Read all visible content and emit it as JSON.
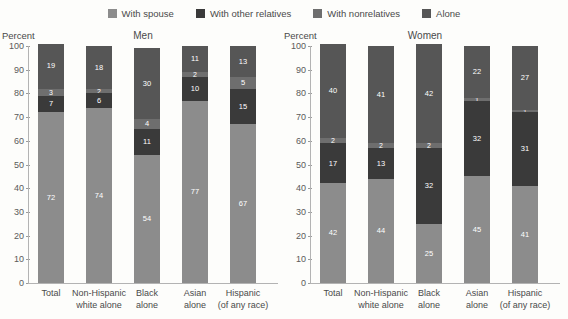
{
  "legend": {
    "items": [
      {
        "label": "With spouse",
        "color": "#8c8c8c",
        "icon": "square-swatch-icon"
      },
      {
        "label": "With other relatives",
        "color": "#3a3a3a",
        "icon": "square-swatch-icon"
      },
      {
        "label": "With nonrelatives",
        "color": "#6e6e6e",
        "icon": "square-swatch-icon"
      },
      {
        "label": "Alone",
        "color": "#565656",
        "icon": "square-swatch-icon"
      }
    ]
  },
  "chart_data": {
    "type": "bar",
    "subtype": "stacked-percent",
    "title": "",
    "panels": [
      {
        "title": "Men",
        "ylabel": "Percent",
        "xlabel": "",
        "ylim": [
          0,
          100
        ],
        "yticks": [
          0,
          10,
          20,
          30,
          40,
          50,
          60,
          70,
          80,
          90,
          100
        ],
        "grid": false,
        "categories": [
          "Total",
          "Non-Hispanic white alone",
          "Black alone",
          "Asian alone",
          "Hispanic (of any race)"
        ],
        "series": [
          {
            "name": "With spouse",
            "color": "#8c8c8c",
            "values": [
              72,
              74,
              54,
              77,
              67
            ]
          },
          {
            "name": "With other relatives",
            "color": "#3a3a3a",
            "values": [
              7,
              6,
              11,
              10,
              15
            ]
          },
          {
            "name": "With nonrelatives",
            "color": "#6e6e6e",
            "values": [
              3,
              2,
              4,
              2,
              5
            ]
          },
          {
            "name": "Alone",
            "color": "#565656",
            "values": [
              19,
              18,
              30,
              11,
              13
            ]
          }
        ]
      },
      {
        "title": "Women",
        "ylabel": "Percent",
        "xlabel": "",
        "ylim": [
          0,
          100
        ],
        "yticks": [
          0,
          10,
          20,
          30,
          40,
          50,
          60,
          70,
          80,
          90,
          100
        ],
        "grid": false,
        "categories": [
          "Total",
          "Non-Hispanic white alone",
          "Black alone",
          "Asian alone",
          "Hispanic (of any race)"
        ],
        "series": [
          {
            "name": "With spouse",
            "color": "#8c8c8c",
            "values": [
              42,
              44,
              25,
              45,
              41
            ]
          },
          {
            "name": "With other relatives",
            "color": "#3a3a3a",
            "values": [
              17,
              13,
              32,
              32,
              31
            ]
          },
          {
            "name": "With nonrelatives",
            "color": "#6e6e6e",
            "values": [
              2,
              2,
              2,
              1,
              1
            ]
          },
          {
            "name": "Alone",
            "color": "#565656",
            "values": [
              40,
              41,
              42,
              22,
              27
            ]
          }
        ]
      }
    ],
    "legend_position": "top-center"
  },
  "xlabel_lines": [
    [
      "Total",
      ""
    ],
    [
      "Non-Hispanic",
      "white alone"
    ],
    [
      "Black",
      "alone"
    ],
    [
      "Asian",
      "alone"
    ],
    [
      "Hispanic",
      "(of any race)"
    ]
  ]
}
